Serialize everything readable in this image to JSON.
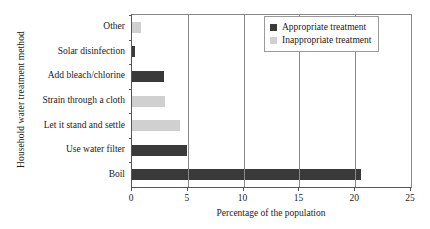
{
  "chart_data": {
    "type": "bar",
    "orientation": "horizontal",
    "title": "",
    "xlabel": "Percentage of the population",
    "ylabel": "Household water treatment method",
    "xlim": [
      0,
      25
    ],
    "xticks": [
      0,
      5,
      10,
      15,
      20,
      25
    ],
    "grid": true,
    "grid_axis": "x",
    "legend_position": "upper right",
    "categories": [
      "Other",
      "Solar disinfection",
      "Add bleach/chlorine",
      "Strain through a cloth",
      "Let it stand and settle",
      "Use water filter",
      "Boil"
    ],
    "values": [
      0.8,
      0.3,
      2.9,
      3.0,
      4.3,
      4.9,
      20.5
    ],
    "point_categories": [
      "Inappropriate treatment",
      "Appropriate treatment",
      "Appropriate treatment",
      "Inappropriate treatment",
      "Inappropriate treatment",
      "Appropriate treatment",
      "Appropriate treatment"
    ],
    "series": [
      {
        "name": "Appropriate treatment",
        "color": "#3a3a3a",
        "points": [
          {
            "category": "Solar disinfection",
            "value": 0.3
          },
          {
            "category": "Add bleach/chlorine",
            "value": 2.9
          },
          {
            "category": "Use water filter",
            "value": 4.9
          },
          {
            "category": "Boil",
            "value": 20.5
          }
        ]
      },
      {
        "name": "Inappropriate treatment",
        "color": "#d0d0d0",
        "points": [
          {
            "category": "Other",
            "value": 0.8
          },
          {
            "category": "Strain through a cloth",
            "value": 3.0
          },
          {
            "category": "Let it stand and settle",
            "value": 4.3
          }
        ]
      }
    ],
    "legend": [
      {
        "label": "Appropriate treatment",
        "color": "#3a3a3a"
      },
      {
        "label": "Inappropriate treatment",
        "color": "#d0d0d0"
      }
    ]
  },
  "axes": {
    "x_title": "Percentage of the population",
    "y_title": "Household water treatment method",
    "x_tick_labels": [
      "0",
      "5",
      "10",
      "15",
      "20",
      "25"
    ]
  },
  "bars": [
    {
      "label": "Other",
      "value": 0.8,
      "series": "Inappropriate treatment"
    },
    {
      "label": "Solar disinfection",
      "value": 0.3,
      "series": "Appropriate treatment"
    },
    {
      "label": "Add bleach/chlorine",
      "value": 2.9,
      "series": "Appropriate treatment"
    },
    {
      "label": "Strain through a cloth",
      "value": 3.0,
      "series": "Inappropriate treatment"
    },
    {
      "label": "Let it stand and settle",
      "value": 4.3,
      "series": "Inappropriate treatment"
    },
    {
      "label": "Use water filter",
      "value": 4.9,
      "series": "Appropriate treatment"
    },
    {
      "label": "Boil",
      "value": 20.5,
      "series": "Appropriate treatment"
    }
  ],
  "legend": {
    "appropriate_label": "Appropriate treatment",
    "inappropriate_label": "Inappropriate treatment"
  },
  "colors": {
    "appropriate": "#3a3a3a",
    "inappropriate": "#d0d0d0",
    "axis": "#555555",
    "grid": "#8a8a8a"
  }
}
